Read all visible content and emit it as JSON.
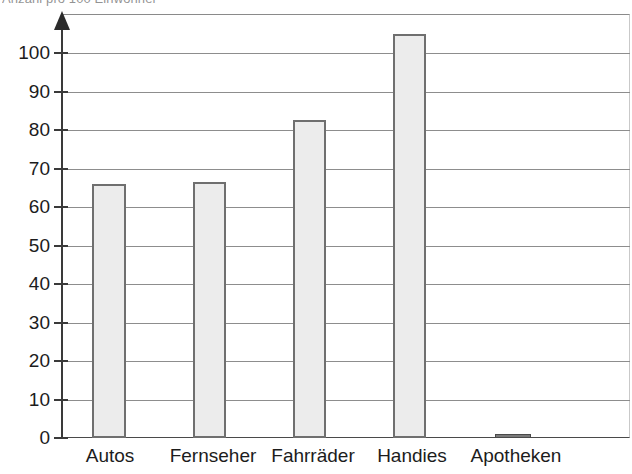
{
  "chart_data": {
    "type": "bar",
    "title": "Anzahl pro 100 Einwohner",
    "xlabel": "",
    "ylabel": "",
    "categories": [
      "Autos",
      "Fernseher",
      "Fahrräder",
      "Handies",
      "Apotheken"
    ],
    "values": [
      66,
      66.5,
      82.5,
      105,
      1
    ],
    "ylim": [
      0,
      110
    ],
    "yticks": [
      0,
      10,
      20,
      30,
      40,
      50,
      60,
      70,
      80,
      90,
      100
    ],
    "ytick_labels": [
      "0",
      "10",
      "20",
      "30",
      "40",
      "50",
      "60",
      "70",
      "80",
      "90",
      "100"
    ],
    "grid": true,
    "legend": false,
    "legend_position": "none",
    "bar_fill_color": "#ececec",
    "bar_border_color": "#6f6f6f",
    "gridline_color": "#8d8d8d",
    "axis_color": "#3a3a3a",
    "axis_arrow": "up-arrow"
  }
}
